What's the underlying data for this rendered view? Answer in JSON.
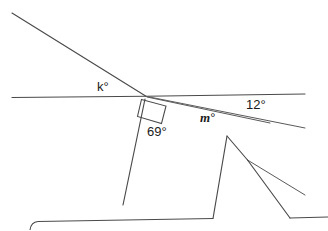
{
  "diagram": {
    "type": "geometry-figure",
    "background_color": "#ffffff",
    "stroke_color": "#4a4a4a",
    "labels": {
      "k": "k°",
      "twelve": "12°",
      "m_variable": "m",
      "m_degree": "°",
      "sixtynine": "69°"
    },
    "known_angles": [
      {
        "name": "12°",
        "value": 12,
        "unit": "degrees"
      },
      {
        "name": "69°",
        "value": 69,
        "unit": "degrees"
      }
    ],
    "unknown_angles": [
      {
        "name": "k°",
        "value": "k",
        "unit": "degrees"
      },
      {
        "name": "m°",
        "value": "m",
        "unit": "degrees"
      }
    ],
    "markers": [
      {
        "name": "right-angle-marker",
        "kind": "square",
        "value": 90,
        "unit": "degrees"
      }
    ],
    "geometry": {
      "intersection_point": {
        "x": 146,
        "y": 96
      },
      "paths": {
        "horizontal_transversal": "M 12 97.5 L 146 96.2 L 305 94",
        "upper_left_diagonal": "M 12 13 L 146 96.2",
        "ray_twelve_degrees": "M 147 96.5 L 305 128",
        "ray_m_degrees": "M 147 97 L 270 123",
        "line_sixtynine": "M 145 99 L 123 205",
        "peak_left_edge": "M 213 218.5 L 227 136",
        "peak_right_edge": "M 227 136 L 247.5 160",
        "vertex_ray_upper": "M 247.5 160 L 305 195",
        "vertex_ray_lower": "M 247.5 160 L 290 218",
        "baseline_bottom": "M 30 230 Q 31 222 38 221.5 L 213 218.5",
        "baseline_right": "M 290 218 L 328 217"
      },
      "right_angle_marker_path": "M 141.5 99.5 L 166 106 L 161.5 123.5 L 137.5 116.5 Z"
    }
  }
}
